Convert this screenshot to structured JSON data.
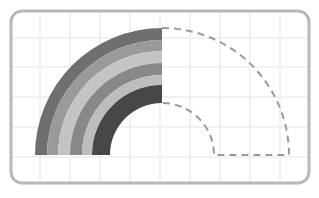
{
  "diagram": {
    "frame": {
      "x": 11,
      "y": 11,
      "width": 298,
      "height": 172,
      "radius": 11,
      "stroke": "#b8b8b8",
      "stroke_width": 3
    },
    "grid": {
      "color": "#ececec",
      "xs": [
        40,
        70,
        100,
        130,
        160,
        190,
        220,
        250,
        280
      ],
      "ys": [
        38,
        67,
        97,
        127,
        157
      ]
    },
    "center": {
      "x": 162,
      "y": 155
    },
    "bands": [
      {
        "name": "band-1",
        "outer_r": 127,
        "inner_r": 115,
        "color": "#6f6f6f"
      },
      {
        "name": "band-2",
        "outer_r": 115,
        "inner_r": 104,
        "color": "#9a9a9a"
      },
      {
        "name": "band-3",
        "outer_r": 104,
        "inner_r": 92,
        "color": "#c4c4c4"
      },
      {
        "name": "band-4",
        "outer_r": 92,
        "inner_r": 80,
        "color": "#888888"
      },
      {
        "name": "band-5",
        "outer_r": 80,
        "inner_r": 70,
        "color": "#bdbdbd"
      },
      {
        "name": "band-6",
        "outer_r": 70,
        "inner_r": 52,
        "color": "#474747"
      }
    ],
    "dashed_outline": {
      "outer_r": 127,
      "inner_r": 52,
      "stroke": "#9a9a9a",
      "stroke_width": 2,
      "dash": "7 5"
    }
  }
}
